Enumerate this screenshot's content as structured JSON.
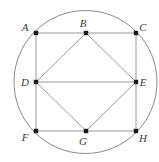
{
  "figure": {
    "canvas": {
      "width": 159,
      "height": 162,
      "background": "#ffffff"
    },
    "colors": {
      "circle_stroke": "#8a8a8a",
      "polygon_stroke": "#9a9a9a",
      "vertex_fill": "#1a1a1a",
      "label_fill": "#3a3a3a"
    },
    "circle": {
      "name": "circumscribed-circle",
      "cx": 85.5,
      "cy": 82.0,
      "r": 71.5
    },
    "outer_square": {
      "name": "outer-square-ACHF",
      "vertices": [
        "A",
        "C",
        "H",
        "F"
      ]
    },
    "inner_square": {
      "name": "inner-square-BEGD",
      "vertices": [
        "B",
        "E",
        "G",
        "D"
      ]
    },
    "points": [
      {
        "id": "A",
        "label": "A",
        "x": 36.0,
        "y": 33.0,
        "label_x": 25.0,
        "label_y": 28.0
      },
      {
        "id": "B",
        "label": "B",
        "x": 86.0,
        "y": 33.0,
        "label_x": 83.0,
        "label_y": 24.0
      },
      {
        "id": "C",
        "label": "C",
        "x": 136.0,
        "y": 33.0,
        "label_x": 143.0,
        "label_y": 28.0
      },
      {
        "id": "D",
        "label": "D",
        "x": 36.0,
        "y": 82.0,
        "label_x": 25.0,
        "label_y": 83.0
      },
      {
        "id": "E",
        "label": "E",
        "x": 136.0,
        "y": 82.0,
        "label_x": 143.0,
        "label_y": 83.0
      },
      {
        "id": "F",
        "label": "F",
        "x": 36.0,
        "y": 131.0,
        "label_x": 25.0,
        "label_y": 138.0
      },
      {
        "id": "G",
        "label": "G",
        "x": 86.0,
        "y": 131.0,
        "label_x": 83.0,
        "label_y": 142.0
      },
      {
        "id": "H",
        "label": "H",
        "x": 136.0,
        "y": 131.0,
        "label_x": 143.0,
        "label_y": 139.0
      }
    ],
    "segments": [
      {
        "name": "segment-A-C",
        "from": "A",
        "to": "C"
      },
      {
        "name": "segment-C-H",
        "from": "C",
        "to": "H"
      },
      {
        "name": "segment-H-F",
        "from": "H",
        "to": "F"
      },
      {
        "name": "segment-F-A",
        "from": "F",
        "to": "A"
      },
      {
        "name": "segment-B-E",
        "from": "B",
        "to": "E"
      },
      {
        "name": "segment-E-G",
        "from": "E",
        "to": "G"
      },
      {
        "name": "segment-G-D",
        "from": "G",
        "to": "D"
      },
      {
        "name": "segment-D-B",
        "from": "D",
        "to": "B"
      },
      {
        "name": "segment-D-E",
        "from": "D",
        "to": "E"
      }
    ]
  }
}
